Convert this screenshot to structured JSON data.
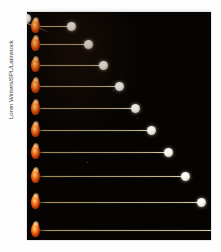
{
  "canvas": {
    "width": 221,
    "height": 252,
    "background": "#ffffff"
  },
  "credit": {
    "text": "Loren Winters/SPL/Latinstock",
    "orientation": "vertical-rotated-90",
    "color": "#3a3a3a"
  },
  "photo": {
    "type": "stroboscopic-multiflash-photograph",
    "subject": "rolling balls launched at increasing speeds",
    "background_color": "#050403",
    "streak_color": "#bcaa7e",
    "emitter_color": "#f4741d",
    "ball_color": "#fbfaf6",
    "frame": {
      "left": 27,
      "top": 12,
      "width": 184,
      "height": 228
    },
    "rows": [
      {
        "label": "trial-1",
        "top": 6,
        "streak_length": 31,
        "ball_x": 36
      },
      {
        "label": "trial-2",
        "top": 24,
        "streak_length": 48,
        "ball_x": 53
      },
      {
        "label": "trial-3",
        "top": 45,
        "streak_length": 63,
        "ball_x": 68
      },
      {
        "label": "trial-4",
        "top": 66,
        "streak_length": 79,
        "ball_x": 84
      },
      {
        "label": "trial-5",
        "top": 88,
        "streak_length": 95,
        "ball_x": 100
      },
      {
        "label": "trial-6",
        "top": 110,
        "streak_length": 111,
        "ball_x": 116
      },
      {
        "label": "trial-7",
        "top": 132,
        "streak_length": 128,
        "ball_x": 133
      },
      {
        "label": "trial-8",
        "top": 156,
        "streak_length": 145,
        "ball_x": 150
      },
      {
        "label": "trial-9",
        "top": 182,
        "streak_length": 161,
        "ball_x": 166
      },
      {
        "label": "trial-10",
        "top": 210,
        "streak_length": 178,
        "ball_x": 183
      }
    ],
    "specks": [
      {
        "x": 86,
        "y": 78
      },
      {
        "x": 110,
        "y": 106
      },
      {
        "x": 60,
        "y": 150
      },
      {
        "x": 138,
        "y": 190
      }
    ]
  }
}
